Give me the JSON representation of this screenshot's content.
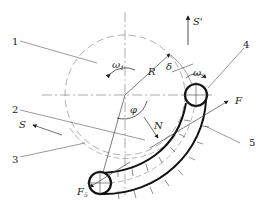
{
  "diagram": {
    "type": "mechanical schematic - pipe/tube bending around a rotating die",
    "part_numbers": [
      "1",
      "2",
      "3",
      "4",
      "5"
    ],
    "symbols": {
      "omega1": "ω",
      "omega1_sub": "1",
      "omega2": "ω",
      "omega2_sub": "2",
      "radius": "R",
      "delta": "δ",
      "phi": "φ",
      "normal_force": "N",
      "force_F": "F",
      "force_F5": "F",
      "force_F5_sub": "5",
      "S": "S",
      "S_prime": "S'"
    },
    "colors": {
      "line": "#222222",
      "thin": "#555555",
      "dashed": "#999999"
    }
  }
}
